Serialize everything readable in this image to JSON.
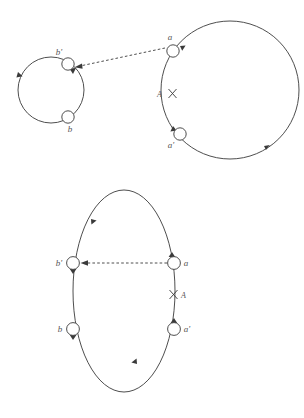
{
  "figure": {
    "title": "",
    "background_color": "#ffffff",
    "stroke_color": "#3a3a3a",
    "label_color": "#555555",
    "panels": [
      {
        "name": "top-panel",
        "description": "Two separate oriented cycles joined by a dashed arrow; a cut marked A on the large cycle",
        "cycles": [
          {
            "name": "small-cycle",
            "center_x": 51,
            "center_y": 90,
            "radius": 33,
            "orientation": "clockwise"
          },
          {
            "name": "large-cycle",
            "center_x": 230,
            "center_y": 90,
            "radius": 69,
            "orientation": "counterclockwise"
          }
        ],
        "nodes": [
          {
            "id": "b-prime-top",
            "label": "b'",
            "x": 68,
            "y": 64,
            "label_dx": -9,
            "label_dy": -9
          },
          {
            "id": "b-top",
            "label": "b",
            "x": 68,
            "y": 117,
            "label_dx": 2,
            "label_dy": 15
          },
          {
            "id": "a-top",
            "label": "a",
            "x": 173,
            "y": 51,
            "label_dx": -3,
            "label_dy": -11
          },
          {
            "id": "a-prime-top",
            "label": "a'",
            "x": 180,
            "y": 134,
            "label_dx": -9,
            "label_dy": 14
          }
        ],
        "cut": {
          "label": "A",
          "x": 166,
          "y": 94,
          "label_side": "left"
        },
        "dashed_edge": {
          "from": "a-top",
          "to": "b-prime-top",
          "style": "dashed",
          "arrow": "to-target"
        }
      },
      {
        "name": "bottom-panel",
        "description": "Single oriented cycle drawn as a tall oval with four nodes; a cut marked A on the right side",
        "cycles": [
          {
            "name": "merged-cycle",
            "center_x": 124,
            "center_y": 291,
            "radius_x": 51,
            "radius_y": 101,
            "orientation": "counterclockwise"
          }
        ],
        "nodes": [
          {
            "id": "b-prime-bottom",
            "label": "b'",
            "x": 73,
            "y": 263,
            "label_dx": -14,
            "label_dy": 2
          },
          {
            "id": "b-bottom",
            "label": "b",
            "x": 73,
            "y": 329,
            "label_dx": -13,
            "label_dy": 2
          },
          {
            "id": "a-bottom",
            "label": "a",
            "x": 174,
            "y": 263,
            "label_dx": 11,
            "label_dy": 2
          },
          {
            "id": "a-prime-bottom",
            "label": "a'",
            "x": 174,
            "y": 329,
            "label_dx": 11,
            "label_dy": 2
          }
        ],
        "cut": {
          "label": "A",
          "x": 180,
          "y": 295,
          "label_side": "right"
        },
        "dashed_edge": {
          "from": "a-bottom",
          "to": "b-prime-bottom",
          "style": "dashed",
          "arrow": "to-target"
        }
      }
    ]
  }
}
